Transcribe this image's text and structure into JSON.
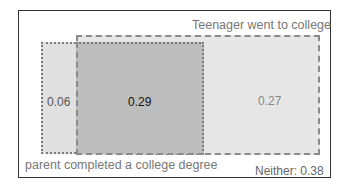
{
  "diagram": {
    "type": "venn-rectangles",
    "set_a_label": "parent completed a college degree",
    "set_b_label": "Teenager went to college",
    "only_a": "0.06",
    "both": "0.29",
    "only_b": "0.27",
    "neither": "Neither: 0.38",
    "colors": {
      "only_a": "#e0e0e0",
      "both": "#bdbdbd",
      "only_b": "#e6e6e6",
      "border": "#333333"
    }
  }
}
